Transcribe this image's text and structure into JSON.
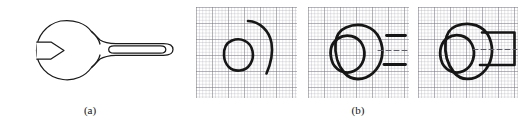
{
  "figure": {
    "background_color": "#ffffff",
    "ink_color": "#1a1a1a",
    "grid_color": "#8d8d95",
    "panels": [
      {
        "id": "a",
        "caption": "(a)",
        "content_name": "wrench-outline-drawing",
        "description": "Clean vector outline of an open-end wrench: circular head with V-shaped jaw notch opening left, tapered neck, and long handle containing an inner rounded-rectangle groove.",
        "stroke_color": "#1a1a1a",
        "fill_color": "#ffffff"
      },
      {
        "id": "b",
        "caption": "(b)",
        "content_name": "sketch-sequence-on-graph-paper",
        "description": "Three graph-paper squares showing a progressive freehand sketch of the wrench.",
        "steps": [
          {
            "index": 1,
            "name": "sketch-step-1",
            "strokes": [
              "closed-circle",
              "open-c-arc"
            ],
            "description": "A small closed circle drawn at left with a larger C-shaped arc opening to the right."
          },
          {
            "index": 2,
            "name": "sketch-step-2",
            "strokes": [
              "closed-circle",
              "enclosing-blob",
              "upper-handle-line",
              "lower-handle-line",
              "center-dashed-line"
            ],
            "description": "The circle is enclosed by a larger rounded blob; two short horizontal handle strokes and a faint dashed centerline appear to the right."
          },
          {
            "index": 3,
            "name": "sketch-step-3",
            "strokes": [
              "closed-circle",
              "enclosing-blob",
              "closed-handle-outline",
              "center-dashed-line"
            ],
            "description": "The handle strokes are closed into a full rectangular handle joined to the head, completing the wrench silhouette."
          }
        ]
      }
    ]
  },
  "captions": {
    "a": "(a)",
    "b": "(b)"
  }
}
